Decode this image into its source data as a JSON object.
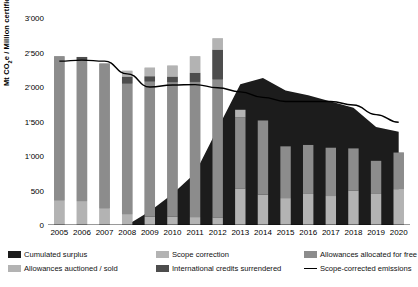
{
  "chart_data": {
    "type": "bar",
    "title": "",
    "subtitle": "",
    "xlabel": "",
    "ylabel": "Mt CO2e / Million certificates",
    "ylabel_html": "Mt CO<sub>2</sub>e / Million certificates",
    "categories": [
      "2005",
      "2006",
      "2007",
      "2008",
      "2009",
      "2010",
      "2011",
      "2012",
      "2013",
      "2014",
      "2015",
      "2016",
      "2017",
      "2018",
      "2019",
      "2020"
    ],
    "ylim": [
      0,
      3000
    ],
    "yticks": [
      0,
      500,
      1000,
      1500,
      2000,
      2500,
      3000
    ],
    "ytick_labels": [
      "0",
      "500",
      "1'000",
      "1'500",
      "2'000",
      "2'500",
      "3'000"
    ],
    "grid": false,
    "legend_position": "bottom",
    "stacking": "vertical",
    "series": [
      {
        "name": "Allowances auctioned / sold",
        "color": "#b3b3b3",
        "role": "bar-stack-1",
        "values": [
          355,
          345,
          240,
          155,
          120,
          120,
          115,
          110,
          530,
          440,
          390,
          450,
          420,
          500,
          450,
          520
        ]
      },
      {
        "name": "Allowances allocated for free",
        "color": "#8c8c8c",
        "role": "bar-stack-2",
        "values": [
          2090,
          2040,
          2100,
          1895,
          1960,
          1950,
          1960,
          2000,
          1030,
          1075,
          750,
          710,
          700,
          610,
          480,
          530
        ]
      },
      {
        "name": "International credits surrendered",
        "color": "#4d4d4d",
        "role": "bar-stack-3",
        "values": [
          0,
          50,
          0,
          100,
          75,
          80,
          130,
          430,
          0,
          0,
          0,
          0,
          0,
          0,
          0,
          0
        ]
      },
      {
        "name": "Scope correction",
        "color": "#b3b3b3",
        "role": "bar-stack-4",
        "values": [
          0,
          0,
          0,
          85,
          125,
          160,
          240,
          165,
          110,
          0,
          0,
          0,
          0,
          0,
          0,
          0
        ]
      }
    ],
    "bar_totals": [
      2445,
      2435,
      2340,
      2235,
      2280,
      2310,
      2445,
      2705,
      1670,
      1515,
      1140,
      1160,
      1120,
      1110,
      930,
      1050
    ],
    "area_series": {
      "name": "Cumulated surplus",
      "color": "#1c1c1c",
      "type": "area",
      "values": [
        0,
        0,
        0,
        0,
        200,
        450,
        750,
        1400,
        2040,
        2130,
        1950,
        1880,
        1790,
        1700,
        1420,
        1350
      ]
    },
    "line_series": {
      "name": "Scope-corrected emissions",
      "color": "#000000",
      "type": "line",
      "values": [
        2375,
        2390,
        2375,
        2190,
        2000,
        2030,
        2035,
        1990,
        1930,
        1850,
        1790,
        1790,
        1790,
        1740,
        1600,
        1490
      ]
    },
    "legend": [
      {
        "label": "Cumulated surplus",
        "color": "#1c1c1c",
        "marker": "square"
      },
      {
        "label": "Scope correction",
        "color": "#b3b3b3",
        "marker": "square"
      },
      {
        "label": "Allowances allocated for free",
        "color": "#8c8c8c",
        "marker": "square"
      },
      {
        "label": "Allowances auctioned / sold",
        "color": "#b3b3b3",
        "marker": "square"
      },
      {
        "label": "International credits surrendered",
        "color": "#4d4d4d",
        "marker": "square"
      },
      {
        "label": "Scope-corrected emissions",
        "color": "#000000",
        "marker": "line"
      }
    ]
  }
}
